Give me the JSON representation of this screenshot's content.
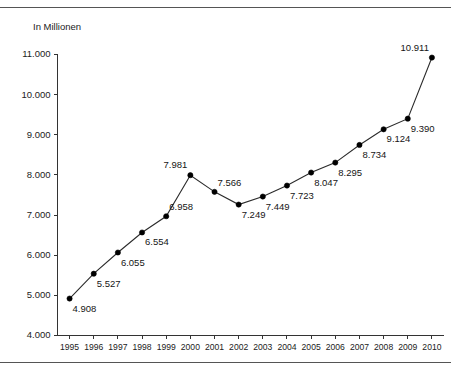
{
  "page": {
    "clipped_header_fragment": "",
    "background_color": "#ffffff",
    "rule_color": "#555555"
  },
  "chart_data": {
    "type": "line",
    "title": "",
    "subtitle": "",
    "xlabel": "",
    "ylabel": "In Millionen",
    "unit_label": "In Millionen",
    "grid": false,
    "legend_position": "none",
    "line_color": "#2b2b2b",
    "marker_color": "#000000",
    "categories": [
      "1995",
      "1996",
      "1997",
      "1998",
      "1999",
      "2000",
      "2001",
      "2002",
      "2003",
      "2004",
      "2005",
      "2006",
      "2007",
      "2008",
      "2009",
      "2010"
    ],
    "x": [
      1995,
      1996,
      1997,
      1998,
      1999,
      2000,
      2001,
      2002,
      2003,
      2004,
      2005,
      2006,
      2007,
      2008,
      2009,
      2010
    ],
    "values": [
      4.908,
      5.527,
      6.055,
      6.554,
      6.958,
      7.981,
      7.566,
      7.249,
      7.449,
      7.723,
      8.047,
      8.295,
      8.734,
      9.124,
      9.39,
      10.911
    ],
    "point_labels": [
      "4.908",
      "5.527",
      "6.055",
      "6.554",
      "6.958",
      "7.981",
      "7.566",
      "7.249",
      "7.449",
      "7.723",
      "8.047",
      "8.295",
      "8.734",
      "9.124",
      "9.390",
      "10.911"
    ],
    "label_placement": [
      "below-right",
      "below-right",
      "below-right",
      "below-right",
      "above-right",
      "above-left",
      "above-right",
      "below-right",
      "below-right",
      "below-right",
      "below-right",
      "below-right",
      "below-right",
      "below-right",
      "below-right",
      "above-left"
    ],
    "ylim": [
      4.0,
      11.0
    ],
    "ytick_values": [
      4.0,
      5.0,
      6.0,
      7.0,
      8.0,
      9.0,
      10.0,
      11.0
    ],
    "ytick_labels": [
      "4.000",
      "5.000",
      "6.000",
      "7.000",
      "8.000",
      "9.000",
      "10.000",
      "11.000"
    ],
    "xlim": [
      1995,
      2010
    ],
    "xtick_labels": [
      "1995",
      "1996",
      "1997",
      "1998",
      "1999",
      "2000",
      "2001",
      "2002",
      "2003",
      "2004",
      "2005",
      "2006",
      "2007",
      "2008",
      "2009",
      "2010"
    ],
    "decimal_separator_note": "German thousands separator: 4.908 = 4908"
  }
}
